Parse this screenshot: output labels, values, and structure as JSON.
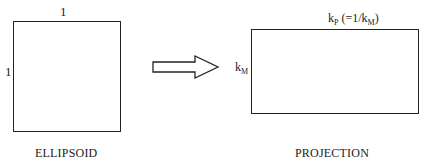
{
  "ellipsoid": {
    "top_label": "1",
    "side_label": "1",
    "caption": "ELLIPSOID"
  },
  "arrow": {
    "icon": "right-arrow-icon"
  },
  "projection": {
    "top_label_main": "k",
    "top_label_sub": "P",
    "top_label_paren_open": " (=1/k",
    "top_label_paren_sub": "M",
    "top_label_paren_close": ")",
    "side_label_main": "k",
    "side_label_sub": "M",
    "caption": "PROJECTION"
  }
}
